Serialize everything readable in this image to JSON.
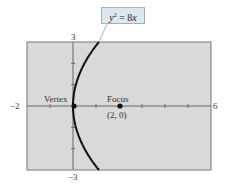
{
  "chart_data": {
    "type": "line",
    "title": "",
    "equation": "y^2 = 8x",
    "xlabel": "",
    "ylabel": "",
    "xlim": [
      -2,
      6
    ],
    "ylim": [
      -3,
      3
    ],
    "x_tick_labels": {
      "min": "−2",
      "max": "6"
    },
    "y_tick_labels": {
      "max": "3",
      "min": "−3"
    },
    "grid": false,
    "background": "#d9d9d9",
    "series": [
      {
        "name": "y^2 = 8x",
        "points": [
          [
            1.125,
            -3
          ],
          [
            0.72,
            -2.4
          ],
          [
            0.405,
            -1.8
          ],
          [
            0.18,
            -1.2
          ],
          [
            0.045,
            -0.6
          ],
          [
            0,
            0
          ],
          [
            0.045,
            0.6
          ],
          [
            0.18,
            1.2
          ],
          [
            0.405,
            1.8
          ],
          [
            0.72,
            2.4
          ],
          [
            1.125,
            3
          ]
        ]
      }
    ],
    "annotations": [
      {
        "label": "Vertex",
        "x": 0,
        "y": 0
      },
      {
        "label": "Focus",
        "sublabel": "(2,  0)",
        "x": 2,
        "y": 0
      }
    ]
  },
  "callout": {
    "base": "y",
    "exp": "2",
    "rest": " = 8",
    "var": "x"
  },
  "labels": {
    "x_min": "−2",
    "x_max": "6",
    "y_max": "3",
    "y_min": "−3",
    "vertex": "Vertex",
    "focus": "Focus",
    "focus_coords": "(2,  0)"
  }
}
